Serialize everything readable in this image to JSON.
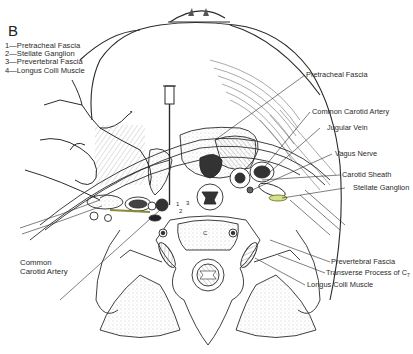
{
  "figure": {
    "panel_letter": "B",
    "legend": [
      {
        "number": "1",
        "text": "1—Pretracheal Fascia"
      },
      {
        "number": "2",
        "text": "2—Stellate Ganglion"
      },
      {
        "number": "3",
        "text": "3—Prevertebral Fascia"
      },
      {
        "number": "4",
        "text": "4—Longus Colli Muscle"
      }
    ],
    "labels": {
      "pretracheal_fascia": "Pretracheal Fascia",
      "common_carotid_artery_right": "Common Carotid Artery",
      "jugular_vein": "Jugular Vein",
      "vagus_nerve": "Vagus Nerve",
      "carotid_sheath": "Carotid Sheath",
      "stellate_ganglion": "Stellate Ganglion",
      "prevertebral_fascia": "Prevertebral Fascia",
      "transverse_process": "Transverse Process of C",
      "transverse_process_sub": "7",
      "longus_colli_muscle": "Longus Colli Muscle",
      "common_carotid_artery_left_line1": "Common",
      "common_carotid_artery_left_line2": "Carotid Artery",
      "vertebra_marker": "C",
      "inline_numbers": [
        "1",
        "2",
        "3"
      ]
    },
    "colors": {
      "ink": "#2a2a2a",
      "background": "#ffffff",
      "stipple": "#9a9a9a",
      "needle_highlight": "#8a8a3a"
    }
  }
}
